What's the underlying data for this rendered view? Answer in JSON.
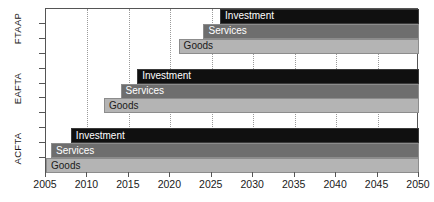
{
  "chart_data": {
    "type": "bar",
    "orientation": "horizontal",
    "title": "",
    "subtitle": "",
    "xlabel": "",
    "ylabel": "",
    "xlim": [
      2005,
      2050
    ],
    "xticks": [
      2005,
      2010,
      2015,
      2020,
      2025,
      2030,
      2035,
      2040,
      2045,
      2050
    ],
    "xtick_labels": [
      "2005",
      "2010",
      "2015",
      "2020",
      "2025",
      "2030",
      "2035",
      "2040",
      "2045",
      "2050"
    ],
    "grid": true,
    "grid_axis": "x",
    "legend": false,
    "groups": [
      "ACFTA",
      "EAFTA",
      "FTAAP"
    ],
    "group_labels_bottom_to_top": [
      "ACFTA",
      "EAFTA",
      "FTAAP"
    ],
    "series": [
      {
        "name": "Goods",
        "color": "#b4b4b4",
        "text_color": "#1a1a1a"
      },
      {
        "name": "Services",
        "color": "#6e6e6e",
        "text_color": "#ffffff"
      },
      {
        "name": "Investment",
        "color": "#101010",
        "text_color": "#ffffff"
      }
    ],
    "bars": [
      {
        "group": "FTAAP",
        "series": "Investment",
        "label": "Investment",
        "start": 2026,
        "end": 2050,
        "row": 0
      },
      {
        "group": "FTAAP",
        "series": "Services",
        "label": "Services",
        "start": 2024,
        "end": 2050,
        "row": 1
      },
      {
        "group": "FTAAP",
        "series": "Goods",
        "label": "Goods",
        "start": 2021,
        "end": 2050,
        "row": 2
      },
      {
        "group": "EAFTA",
        "series": "Investment",
        "label": "Investment",
        "start": 2016,
        "end": 2050,
        "row": 4
      },
      {
        "group": "EAFTA",
        "series": "Services",
        "label": "Services",
        "start": 2014,
        "end": 2050,
        "row": 5
      },
      {
        "group": "EAFTA",
        "series": "Goods",
        "label": "Goods",
        "start": 2012,
        "end": 2050,
        "row": 6
      },
      {
        "group": "ACFTA",
        "series": "Investment",
        "label": "Investment",
        "start": 2008,
        "end": 2050,
        "row": 8
      },
      {
        "group": "ACFTA",
        "series": "Services",
        "label": "Services",
        "start": 2005.6,
        "end": 2050,
        "row": 9
      },
      {
        "group": "ACFTA",
        "series": "Goods",
        "label": "Goods",
        "start": 2005,
        "end": 2050,
        "row": 10
      }
    ]
  },
  "axis": {
    "y_labels": [
      {
        "text": "FTAAP",
        "center_row": 1
      },
      {
        "text": "EAFTA",
        "center_row": 5
      },
      {
        "text": "ACFTA",
        "center_row": 9
      }
    ]
  },
  "colors": {
    "investment": "#101010",
    "services": "#6e6e6e",
    "goods": "#b4b4b4",
    "axis": "#555555",
    "grid": "#9a9a9a",
    "background": "#ffffff"
  }
}
